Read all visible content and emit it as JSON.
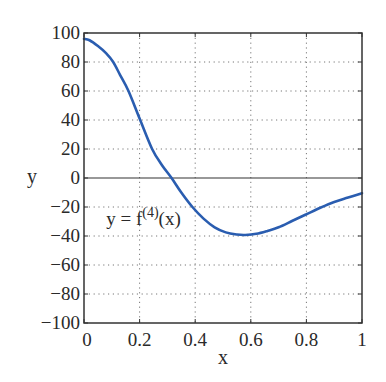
{
  "chart_data": {
    "type": "line",
    "title": "",
    "xlabel": "x",
    "ylabel": "y",
    "xlim": [
      0,
      1
    ],
    "ylim": [
      -100,
      100
    ],
    "grid": true,
    "grid_style": "dotted",
    "zero_line": true,
    "x_ticks": [
      0,
      0.2,
      0.4,
      0.6,
      0.8,
      1
    ],
    "x_tick_labels": [
      "0",
      "0.2",
      "0.4",
      "0.6",
      "0.8",
      "1"
    ],
    "y_ticks": [
      100,
      80,
      60,
      40,
      20,
      0,
      -20,
      -40,
      -60,
      -80,
      -100
    ],
    "y_tick_labels": [
      "100",
      "80",
      "60",
      "40",
      "20",
      "0",
      "−20",
      "−40",
      "−60",
      "−80",
      "−100"
    ],
    "annotation": {
      "text_main": "y = f",
      "text_sup": "(4)",
      "text_tail": "(x)",
      "x": 0.08,
      "y": -28
    },
    "series": [
      {
        "name": "y = f(4)(x)",
        "color": "#2a5db0",
        "x": [
          0,
          0.02,
          0.05,
          0.08,
          0.105,
          0.13,
          0.16,
          0.2,
          0.245,
          0.28,
          0.315,
          0.35,
          0.39,
          0.43,
          0.47,
          0.51,
          0.55,
          0.58,
          0.62,
          0.66,
          0.7,
          0.75,
          0.8,
          0.85,
          0.9,
          0.95,
          1.0
        ],
        "values": [
          96,
          95,
          91,
          86,
          80,
          71,
          60,
          41,
          20,
          9,
          0,
          -10,
          -20,
          -28,
          -34,
          -37.5,
          -39,
          -39.3,
          -38.5,
          -36.5,
          -34,
          -29.5,
          -25,
          -20.5,
          -16.5,
          -13.5,
          -10.5
        ]
      }
    ]
  }
}
